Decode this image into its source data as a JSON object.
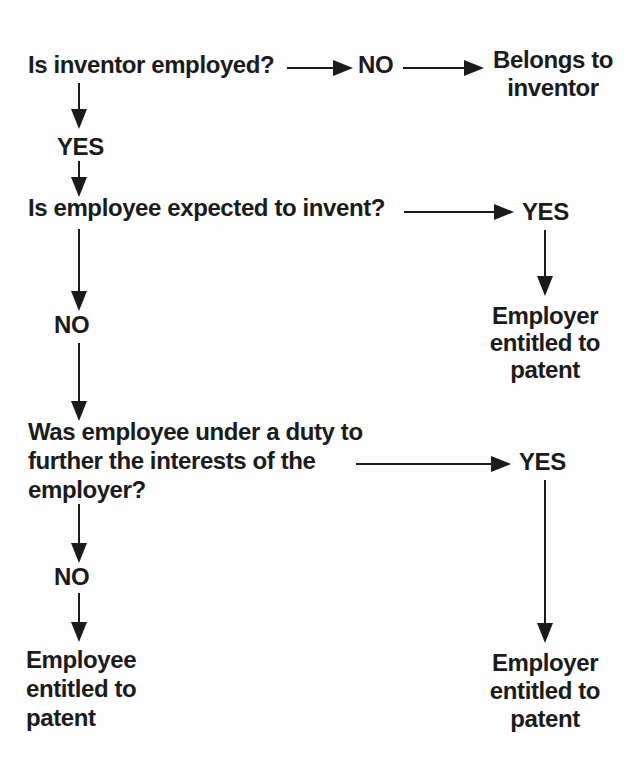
{
  "flowchart": {
    "q1": "Is inventor employed?",
    "q1_no": "NO",
    "q1_yes": "YES",
    "outcome_inventor": [
      "Belongs to",
      "inventor"
    ],
    "q2": "Is employee expected to invent?",
    "q2_yes": "YES",
    "q2_no": "NO",
    "outcome_employer_top": [
      "Employer",
      "entitled to",
      "patent"
    ],
    "q3": [
      "Was employee under a duty to",
      "further the interests of the",
      "employer?"
    ],
    "q3_yes": "YES",
    "q3_no": "NO",
    "outcome_employer_bottom": [
      "Employer",
      "entitled to",
      "patent"
    ],
    "outcome_employee": [
      "Employee",
      "entitled to",
      "patent"
    ],
    "edges": [
      {
        "from": "Is inventor employed?",
        "answer": "NO",
        "to": "Belongs to inventor"
      },
      {
        "from": "Is inventor employed?",
        "answer": "YES",
        "to": "Is employee expected to invent?"
      },
      {
        "from": "Is employee expected to invent?",
        "answer": "YES",
        "to": "Employer entitled to patent"
      },
      {
        "from": "Is employee expected to invent?",
        "answer": "NO",
        "to": "Was employee under a duty to further the interests of the employer?"
      },
      {
        "from": "Was employee under a duty to further the interests of the employer?",
        "answer": "YES",
        "to": "Employer entitled to patent"
      },
      {
        "from": "Was employee under a duty to further the interests of the employer?",
        "answer": "NO",
        "to": "Employee entitled to patent"
      }
    ]
  },
  "colors": {
    "ink": "#1b1b1b",
    "paper": "#fdfdfd"
  }
}
